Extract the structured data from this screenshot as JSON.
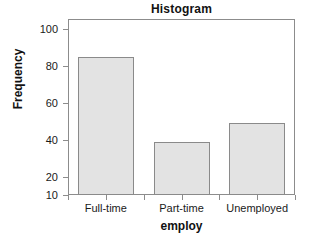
{
  "chart_data": {
    "type": "bar",
    "title": "Histogram",
    "xlabel": "employ",
    "ylabel": "Frequency",
    "categories": [
      "Full-time",
      "Part-time",
      "Unemployed"
    ],
    "values": [
      85,
      39,
      49
    ],
    "ylim": [
      10,
      105
    ],
    "yticks": [
      10,
      20,
      40,
      60,
      80,
      100
    ],
    "ytick_labels": [
      "10",
      "20",
      "40",
      "60",
      "80",
      "100"
    ],
    "grid": false,
    "legend": null,
    "bar_fill_color": "#e3e3e3",
    "bar_border_color": "#8a8a8a",
    "axis_color": "#8c8c8c",
    "text_color": "#1a1a1a"
  }
}
